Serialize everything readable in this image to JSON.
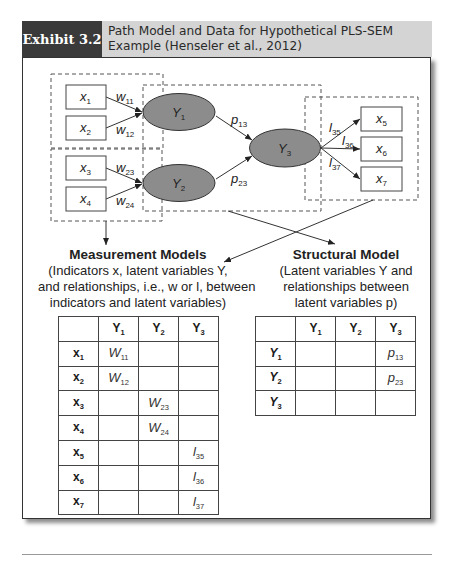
{
  "header": {
    "exhibit_label": "Exhibit 3.2",
    "title_line1": "Path Model and Data for Hypothetical PLS-SEM",
    "title_line2": "Example (Henseler et al., 2012)"
  },
  "diagram": {
    "indicators": [
      {
        "var": "x",
        "sub": "1"
      },
      {
        "var": "x",
        "sub": "2"
      },
      {
        "var": "x",
        "sub": "3"
      },
      {
        "var": "x",
        "sub": "4"
      },
      {
        "var": "x",
        "sub": "5"
      },
      {
        "var": "x",
        "sub": "6"
      },
      {
        "var": "x",
        "sub": "7"
      }
    ],
    "latent": [
      {
        "var": "Y",
        "sub": "1"
      },
      {
        "var": "Y",
        "sub": "2"
      },
      {
        "var": "Y",
        "sub": "3"
      }
    ],
    "weights": [
      {
        "var": "w",
        "sub": "11"
      },
      {
        "var": "w",
        "sub": "12"
      },
      {
        "var": "w",
        "sub": "23"
      },
      {
        "var": "w",
        "sub": "24"
      }
    ],
    "paths": [
      {
        "var": "p",
        "sub": "13"
      },
      {
        "var": "p",
        "sub": "23"
      }
    ],
    "loadings": [
      {
        "var": "l",
        "sub": "35"
      },
      {
        "var": "l",
        "sub": "36"
      },
      {
        "var": "l",
        "sub": "37"
      }
    ],
    "colors": {
      "ellipse_fill": "#8c8c8c",
      "line": "#333333",
      "dash": "#555555"
    }
  },
  "measurement": {
    "title": "Measurement Models",
    "line1": "(Indicators x, latent variables Y,",
    "line2": "and relationships, i.e., w or l, between",
    "line3": "indicators and latent variables)"
  },
  "structural": {
    "title": "Structural Model",
    "line1": "(Latent variables Y and",
    "line2": "relationships between",
    "line3": "latent variables p)"
  },
  "measurement_table": {
    "columns": [
      {
        "var": "Y",
        "sub": "1"
      },
      {
        "var": "Y",
        "sub": "2"
      },
      {
        "var": "Y",
        "sub": "3"
      }
    ],
    "rows": [
      {
        "var": "x",
        "sub": "1",
        "cells": [
          {
            "var": "W",
            "sub": "11"
          },
          null,
          null
        ]
      },
      {
        "var": "x",
        "sub": "2",
        "cells": [
          {
            "var": "W",
            "sub": "12"
          },
          null,
          null
        ]
      },
      {
        "var": "x",
        "sub": "3",
        "cells": [
          null,
          {
            "var": "W",
            "sub": "23"
          },
          null
        ]
      },
      {
        "var": "x",
        "sub": "4",
        "cells": [
          null,
          {
            "var": "W",
            "sub": "24"
          },
          null
        ]
      },
      {
        "var": "x",
        "sub": "5",
        "cells": [
          null,
          null,
          {
            "var": "l",
            "sub": "35"
          }
        ]
      },
      {
        "var": "x",
        "sub": "6",
        "cells": [
          null,
          null,
          {
            "var": "l",
            "sub": "36"
          }
        ]
      },
      {
        "var": "x",
        "sub": "7",
        "cells": [
          null,
          null,
          {
            "var": "l",
            "sub": "37"
          }
        ]
      }
    ]
  },
  "structural_table": {
    "columns": [
      {
        "var": "Y",
        "sub": "1"
      },
      {
        "var": "Y",
        "sub": "2"
      },
      {
        "var": "Y",
        "sub": "3"
      }
    ],
    "rows": [
      {
        "var": "Y",
        "sub": "1",
        "cells": [
          null,
          null,
          {
            "var": "p",
            "sub": "13"
          }
        ]
      },
      {
        "var": "Y",
        "sub": "2",
        "cells": [
          null,
          null,
          {
            "var": "p",
            "sub": "23"
          }
        ]
      },
      {
        "var": "Y",
        "sub": "3",
        "cells": [
          null,
          null,
          null
        ]
      }
    ]
  }
}
